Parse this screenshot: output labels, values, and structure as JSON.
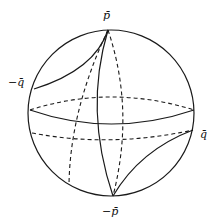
{
  "figure": {
    "type": "sphere-diagram",
    "labels": {
      "top": "p̄",
      "bottom": "−p̄",
      "left": "−q̄",
      "right": "q̄"
    },
    "curves": [
      {
        "name": "outer-circle",
        "style": "solid"
      },
      {
        "name": "equator-front",
        "style": "solid"
      },
      {
        "name": "equator-back",
        "style": "dashed"
      },
      {
        "name": "lower-parallel",
        "style": "dashed"
      },
      {
        "name": "meridian-front",
        "style": "solid"
      },
      {
        "name": "meridian-back-left",
        "style": "dashed"
      },
      {
        "name": "meridian-back-right",
        "style": "dashed"
      },
      {
        "name": "geodesic-p-to-minus-q",
        "style": "solid"
      },
      {
        "name": "geodesic-minus-p-to-q",
        "style": "solid"
      }
    ],
    "colors": {
      "stroke": "#1a1a1a",
      "background": "#ffffff"
    }
  }
}
